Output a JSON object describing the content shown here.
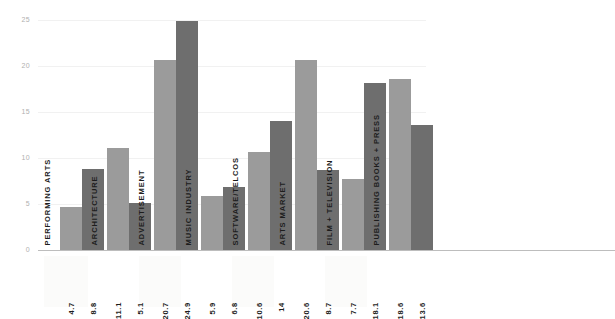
{
  "chart_data": {
    "type": "bar",
    "title": "",
    "subtitle": "",
    "xlabel": "",
    "ylabel": "",
    "ylim": [
      0,
      25
    ],
    "yticks": [
      "0",
      "5",
      "10",
      "15",
      "20",
      "25"
    ],
    "grid": true,
    "legend": "none",
    "orientation": "vertical",
    "categories": [
      "PERFORMING ARTS",
      "ARCHITECTURE",
      "ADVERTISEMENT",
      "MUSIC INDUSTRY",
      "SOFTWARE/TELCOS",
      "ARTS MARKET",
      "FILM + TELEVISION",
      "PUBLISHING BOOKS + PRESS"
    ],
    "series": [
      {
        "name": "series-1",
        "color": "#9b9b9b",
        "values": [
          4.7,
          11.1,
          20.7,
          5.9,
          10.6,
          20.6,
          7.7,
          18.6
        ]
      },
      {
        "name": "series-2",
        "color": "#6e6e6e",
        "values": [
          8.8,
          5.1,
          24.9,
          6.8,
          14,
          8.7,
          18.1,
          13.6
        ]
      }
    ],
    "value_labels": [
      "4.7",
      "8.8",
      "11.1",
      "5.1",
      "20.7",
      "24.9",
      "5.9",
      "6.8",
      "10.6",
      "14",
      "20.6",
      "8.7",
      "7.7",
      "18.1",
      "18.6",
      "13.6"
    ]
  },
  "colors": {
    "series_light": "#9b9b9b",
    "series_dark": "#6e6e6e",
    "gridline": "#f1f1f1",
    "axis": "#bdbdbd",
    "tick_text": "#b0b0b0",
    "label_text": "#1d1d1d",
    "background": "#ffffff"
  }
}
